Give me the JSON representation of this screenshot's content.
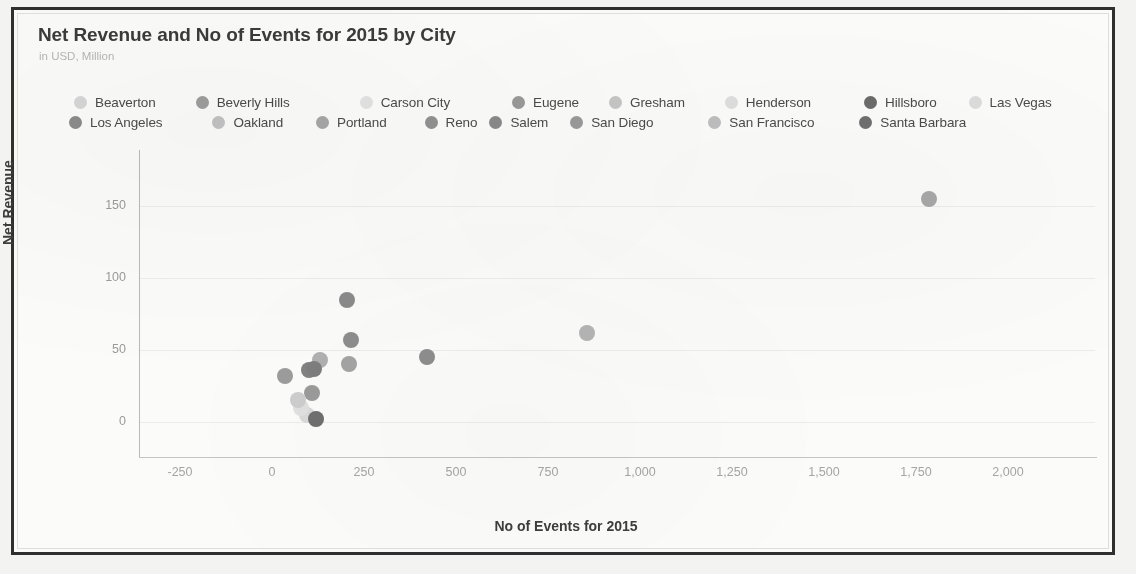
{
  "chart": {
    "title": "Net Revenue and No of Events for 2015 by City",
    "subtitle": "in USD, Million"
  },
  "chart_data": {
    "type": "scatter",
    "title": "Net Revenue and No of Events for 2015 by City",
    "subtitle": "in USD, Million",
    "xlabel": "No of Events for 2015",
    "ylabel": "Net Revenue",
    "xlim": [
      -340,
      2120
    ],
    "ylim": [
      -30,
      178
    ],
    "xticks": [
      "-250",
      "0",
      "250",
      "500",
      "750",
      "1,000",
      "1,250",
      "1,500",
      "1,750",
      "2,000"
    ],
    "xtick_values": [
      -250,
      0,
      250,
      500,
      750,
      1000,
      1250,
      1500,
      1750,
      2000
    ],
    "yticks": [
      "0",
      "50",
      "100",
      "150"
    ],
    "ytick_values": [
      0,
      50,
      100,
      150
    ],
    "grid": true,
    "legend_position": "top",
    "points": [
      {
        "label": "Beaverton",
        "x": 95,
        "y": 5,
        "color": "#d9d9d9"
      },
      {
        "label": "Beverly Hills",
        "x": 215,
        "y": 57,
        "color": "#8e8e8e"
      },
      {
        "label": "Carson City",
        "x": 80,
        "y": 10,
        "color": "#e0e0e0"
      },
      {
        "label": "Eugene",
        "x": 110,
        "y": 20,
        "color": "#9a9a9a"
      },
      {
        "label": "Gresham",
        "x": 70,
        "y": 15,
        "color": "#cdcdcd"
      },
      {
        "label": "Henderson",
        "x": 120,
        "y": 2,
        "color": "#dcdcdc"
      },
      {
        "label": "Hillsboro",
        "x": 120,
        "y": 2,
        "color": "#6f6f6f"
      },
      {
        "label": "Las Vegas",
        "x": 1785,
        "y": 155,
        "color": "#a8a8a8"
      },
      {
        "label": "Los Angeles",
        "x": 100,
        "y": 36,
        "color": "#828282"
      },
      {
        "label": "Oakland",
        "x": 130,
        "y": 43,
        "color": "#b0b0b0"
      },
      {
        "label": "Portland",
        "x": 205,
        "y": 85,
        "color": "#8b8b8b"
      },
      {
        "label": "Reno",
        "x": 420,
        "y": 45,
        "color": "#8d8d8d"
      },
      {
        "label": "Salem",
        "x": 35,
        "y": 32,
        "color": "#9c9c9c"
      },
      {
        "label": "San Diego",
        "x": 210,
        "y": 40,
        "color": "#a3a3a3"
      },
      {
        "label": "San Francisco",
        "x": 855,
        "y": 62,
        "color": "#b4b4b4"
      },
      {
        "label": "Santa Barbara",
        "x": 115,
        "y": 37,
        "color": "#7d7d7d"
      }
    ]
  },
  "legend": {
    "rows": [
      [
        {
          "label": "Beaverton",
          "color": "#d6d6d6"
        },
        {
          "label": "Beverly Hills",
          "color": "#9d9d9d"
        },
        {
          "label": "Carson City",
          "color": "#e2e2e2"
        },
        {
          "label": "Eugene",
          "color": "#999999"
        },
        {
          "label": "Gresham",
          "color": "#c6c6c6"
        },
        {
          "label": "Henderson",
          "color": "#dedede"
        },
        {
          "label": "Hillsboro",
          "color": "#6b6b6b"
        },
        {
          "label": "Las Vegas",
          "color": "#dcdcdc"
        }
      ],
      [
        {
          "label": "Los Angeles",
          "color": "#8b8b8b"
        },
        {
          "label": "Oakland",
          "color": "#c2c2c2"
        },
        {
          "label": "Portland",
          "color": "#a6a6a6"
        },
        {
          "label": "Reno",
          "color": "#919191"
        },
        {
          "label": "Salem",
          "color": "#8a8a8a"
        },
        {
          "label": "San Diego",
          "color": "#9a9a9a"
        },
        {
          "label": "San Francisco",
          "color": "#bdbdbd"
        },
        {
          "label": "Santa Barbara",
          "color": "#6f6f6f"
        }
      ]
    ]
  }
}
